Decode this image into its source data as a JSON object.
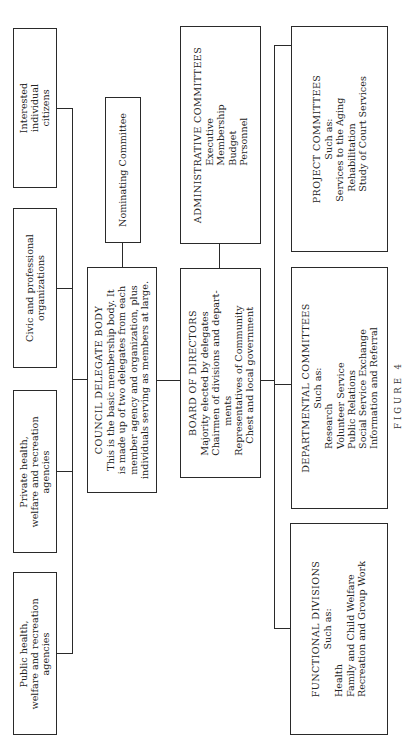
{
  "diagram": {
    "caption": "FIGURE 4",
    "membership_sources": [
      {
        "lines": [
          "Interested",
          "individual",
          "citizens"
        ]
      },
      {
        "lines": [
          "Civic and professional",
          "organizations"
        ]
      },
      {
        "lines": [
          "Private health,",
          "welfare and recreation",
          "agencies"
        ]
      },
      {
        "lines": [
          "Public health,",
          "welfare and recreation",
          "agencies"
        ]
      }
    ],
    "nominating_committee": {
      "title": "Nominating Committee"
    },
    "council_delegate_body": {
      "title": "COUNCIL DELEGATE BODY",
      "lines": [
        "This is the basic membership body. It",
        "is made up of two delegates from each",
        "member agency and organization, plus",
        "individuals serving as members at large."
      ]
    },
    "administrative_committees": {
      "title": "ADMINISTRATIVE COMMITTEES",
      "items": [
        "Executive",
        "Membership",
        "Budget",
        "Personnel"
      ]
    },
    "board_of_directors": {
      "title": "BOARD OF DIRECTORS",
      "lines": [
        "Majority elected by delegates",
        "Chairmen of divisions and depart-",
        "ments",
        "Representatives of Community",
        "Chest and local government"
      ]
    },
    "project_committees": {
      "title": "PROJECT COMMITTEES",
      "subtitle": "Such as:",
      "items": [
        "Services to the Aging",
        "Rehabilitation",
        "Study of Court Services"
      ]
    },
    "departmental_committees": {
      "title": "DEPARTMENTAL COMMITTEES",
      "subtitle": "Such as:",
      "items": [
        "Research",
        "Volunteer Service",
        "Public Relations",
        "Social Service Exchange",
        "Information and Referral"
      ]
    },
    "functional_divisions": {
      "title": "FUNCTIONAL DIVISIONS",
      "subtitle": "Such as:",
      "items": [
        "Health",
        "Family and Child Welfare",
        "Recreation and Group Work"
      ]
    }
  }
}
